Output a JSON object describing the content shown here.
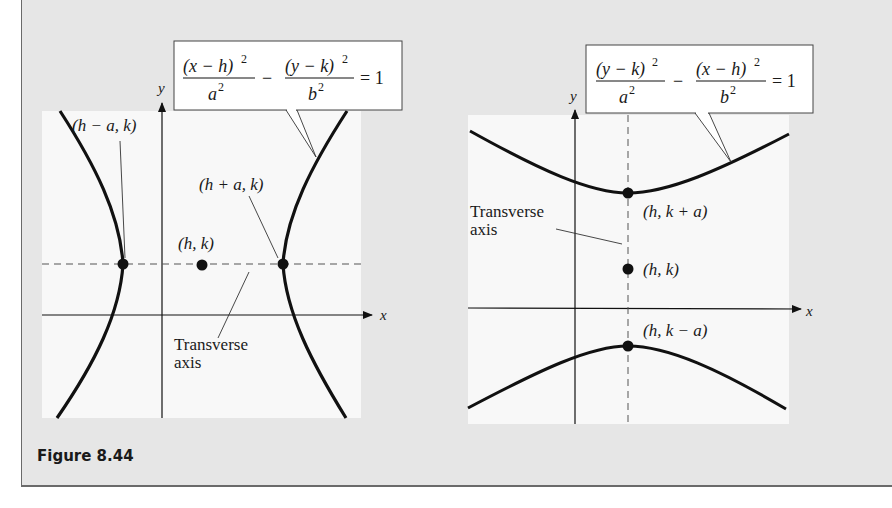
{
  "figure": {
    "caption": "Figure 8.44",
    "background_color": "#e6e6e6",
    "plot_background": "#f8f8f8",
    "curve_color": "#111111"
  },
  "left_graph": {
    "orientation": "horizontal transverse axis",
    "equation": {
      "term1_num": "(x − h)",
      "term1_den": "a",
      "term2_num": "(y − k)",
      "term2_den": "b",
      "exponent": "2",
      "minus": "−",
      "rhs": "= 1"
    },
    "axis_labels": {
      "x": "x",
      "y": "y"
    },
    "points": [
      {
        "label": "(h − a, k)",
        "role": "vertex-left"
      },
      {
        "label": "(h, k)",
        "role": "center"
      },
      {
        "label": "(h + a, k)",
        "role": "vertex-right"
      }
    ],
    "annotation": {
      "line1": "Transverse",
      "line2": "axis"
    }
  },
  "right_graph": {
    "orientation": "vertical transverse axis",
    "equation": {
      "term1_num": "(y − k)",
      "term1_den": "a",
      "term2_num": "(x − h)",
      "term2_den": "b",
      "exponent": "2",
      "minus": "−",
      "rhs": "= 1"
    },
    "axis_labels": {
      "x": "x",
      "y": "y"
    },
    "points": [
      {
        "label": "(h, k + a)",
        "role": "vertex-top"
      },
      {
        "label": "(h, k)",
        "role": "center"
      },
      {
        "label": "(h, k − a)",
        "role": "vertex-bottom"
      }
    ],
    "annotation": {
      "line1": "Transverse",
      "line2": "axis"
    }
  }
}
